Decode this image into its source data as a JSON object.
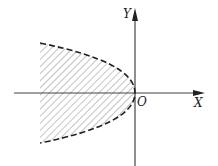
{
  "diagram": {
    "type": "coordinate-plane-region",
    "axes": {
      "x_label": "X",
      "y_label": "Y",
      "origin_label": "O"
    },
    "curve": {
      "kind": "parabola",
      "opens": "left",
      "vertex": "O",
      "style": "dashed"
    },
    "region": {
      "fill": "hatched",
      "location": "inside parabola, left of Y axis"
    },
    "colors": {
      "axis": "#444444",
      "curve": "#222222",
      "hatch": "#888888"
    }
  }
}
